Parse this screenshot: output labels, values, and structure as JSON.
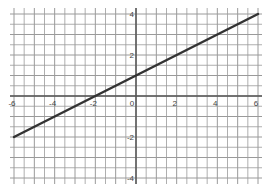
{
  "chart_data": {
    "type": "line",
    "title": "",
    "xlabel": "",
    "ylabel": "",
    "xlim": [
      -6,
      6
    ],
    "ylim": [
      -4,
      4
    ],
    "grid": true,
    "grid_step": 0.5,
    "x_ticks": [
      -6,
      -4,
      -2,
      0,
      2,
      4,
      6
    ],
    "x_tick_labels": [
      "-6",
      "-4",
      "-2",
      "0",
      "2",
      "4",
      "6"
    ],
    "y_ticks": [
      4,
      2,
      -2,
      -4
    ],
    "y_tick_labels": [
      "4",
      "2",
      "-2",
      "-4"
    ],
    "series": [
      {
        "name": "y = 0.5x + 1",
        "x": [
          -6,
          6
        ],
        "y": [
          -2,
          4
        ],
        "color": "#333333"
      }
    ]
  },
  "colors": {
    "grid": "#9a9a9a",
    "axis": "#555555",
    "line": "#333333"
  }
}
